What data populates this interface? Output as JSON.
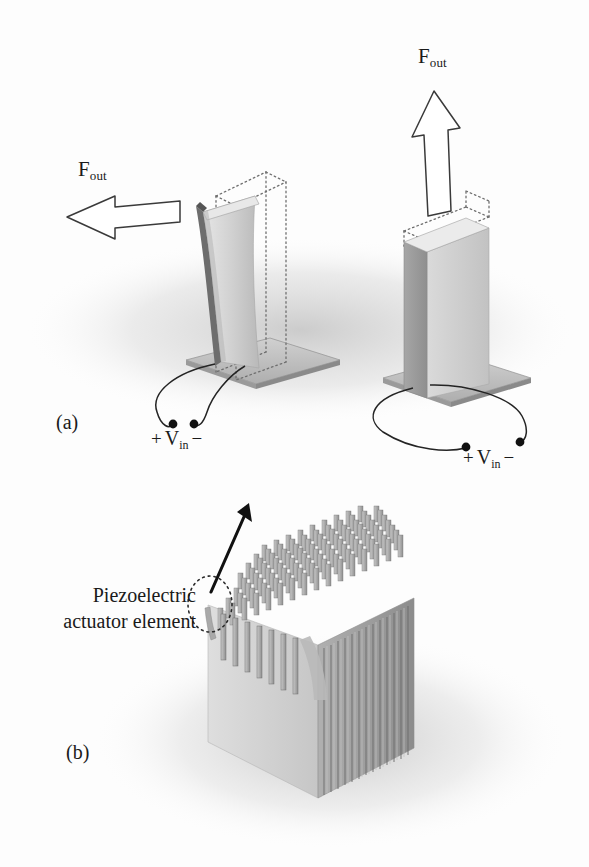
{
  "figure": {
    "background_color": "#fdfdfd",
    "ink_color": "#1a1a1a",
    "body_light": "#d8d8d8",
    "body_mid": "#bcbcbc",
    "body_dark": "#9a9a9a",
    "shadow_color": "#d3d3d3"
  },
  "panels": [
    {
      "id": "a",
      "label": "(a)",
      "devices": [
        {
          "name": "bending-actuator",
          "force_label": {
            "symbol": "F",
            "subscript": "out"
          },
          "arrow_direction": "left",
          "voltage_label": {
            "plus": "+",
            "symbol": "V",
            "subscript": "in",
            "minus": "−"
          },
          "deformed": true,
          "undeformed_outline": "dotted"
        },
        {
          "name": "extensional-actuator",
          "force_label": {
            "symbol": "F",
            "subscript": "out"
          },
          "arrow_direction": "up",
          "voltage_label": {
            "plus": "+",
            "symbol": "V",
            "subscript": "in",
            "minus": "−"
          },
          "deformed": false,
          "undeformed_outline": "dotted"
        }
      ]
    },
    {
      "id": "b",
      "label": "(b)",
      "callout": {
        "line1": "Piezoelectric",
        "line2": "actuator element",
        "marker": "dotted-ellipse",
        "pointer": "solid-arrow-up-right"
      },
      "array": {
        "name": "actuator-element-array",
        "rows": 9,
        "columns": 13,
        "element_shape": "post"
      }
    }
  ],
  "labels": {
    "f_out_left": "F",
    "f_out_left_sub": "out",
    "f_out_right": "F",
    "f_out_right_sub": "out",
    "v_in_left_plus": "+",
    "v_in_left_sym": "V",
    "v_in_left_sub": "in",
    "v_in_left_minus": "−",
    "v_in_right_plus": "+",
    "v_in_right_sym": "V",
    "v_in_right_sub": "in",
    "v_in_right_minus": "−",
    "panel_a": "(a)",
    "panel_b": "(b)",
    "callout_line1": "Piezoelectric",
    "callout_line2": "actuator element"
  }
}
